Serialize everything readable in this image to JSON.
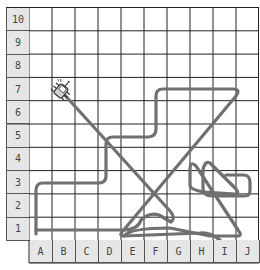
{
  "board": {
    "rows": [
      "10",
      "9",
      "8",
      "7",
      "6",
      "5",
      "4",
      "3",
      "2",
      "1"
    ],
    "columns": [
      "A",
      "B",
      "C",
      "D",
      "E",
      "F",
      "G",
      "H",
      "I",
      "J"
    ],
    "grid_color": "#222222",
    "label_bg": "#e6e6e6",
    "path_color": "#707070"
  },
  "robot": {
    "cell": "B7",
    "icon": "robot-bug-icon"
  },
  "path": {
    "description": "Robot trajectory drawn as a continuous gray line across the grid",
    "start_cell": "A1",
    "end_cell": "B7"
  }
}
